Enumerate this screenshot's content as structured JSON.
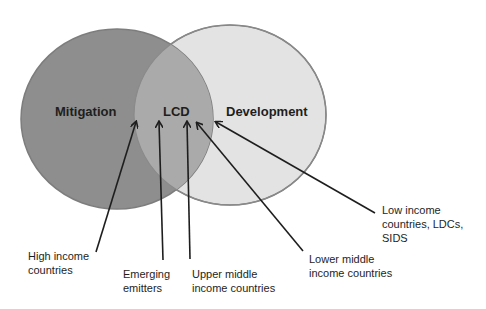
{
  "diagram": {
    "type": "venn",
    "colors": {
      "background": "#ffffff",
      "mitigation_fill": "#8e8e8e",
      "development_fill": "#e3e3e3",
      "overlap_fill": "#aaaaaa",
      "circle_stroke": "#7d7d7d",
      "text": "#1e1e1e",
      "arrow": "#1e1e1e"
    },
    "circles": [
      {
        "id": "mitigation",
        "label": "Mitigation"
      },
      {
        "id": "development",
        "label": "Development"
      }
    ],
    "overlap": {
      "label": "LCD"
    },
    "callouts": [
      {
        "id": "high-income",
        "lines": [
          "High income",
          "countries"
        ]
      },
      {
        "id": "emerging-emitters",
        "lines": [
          "Emerging",
          "emitters"
        ]
      },
      {
        "id": "upper-middle",
        "lines": [
          "Upper middle",
          "income countries"
        ]
      },
      {
        "id": "lower-middle",
        "lines": [
          "Lower middle",
          "income countries"
        ]
      },
      {
        "id": "low-income",
        "lines": [
          "Low income",
          "countries, LDCs,",
          "SIDS"
        ]
      }
    ]
  }
}
